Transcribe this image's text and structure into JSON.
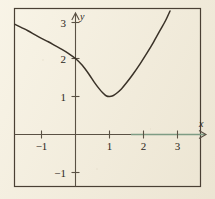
{
  "figure": {
    "background_color": "#f0ead9",
    "frame_color": "#4a4034",
    "axis_color": "#5a5144",
    "axis_highlight_color": "#7e9c84",
    "curve_color": "#3a3228",
    "label_color": "#2b2620"
  },
  "axes": {
    "x_name": "x",
    "y_name": "y",
    "x_ticks": [
      {
        "value": -1,
        "label": "−1"
      },
      {
        "value": 1,
        "label": "1"
      },
      {
        "value": 2,
        "label": "2"
      },
      {
        "value": 3,
        "label": "3"
      }
    ],
    "y_ticks": [
      {
        "value": 3,
        "label": "3"
      },
      {
        "value": 2,
        "label": "2"
      },
      {
        "value": 1,
        "label": "1"
      },
      {
        "value": -1,
        "label": "−1"
      }
    ]
  },
  "chart_data": {
    "type": "line",
    "title": "",
    "subtitle": "",
    "xlabel": "x",
    "ylabel": "y",
    "xlim": [
      -1.78,
      3.68
    ],
    "ylim": [
      -1.35,
      3.32
    ],
    "grid": false,
    "legend": null,
    "annotations": [],
    "series": [
      {
        "name": "curve",
        "color": "#3a3228",
        "minimum": {
          "x": 1,
          "y": 1
        },
        "y_intercept": 2,
        "x": [
          -1.78,
          -1.6,
          -1.4,
          -1.2,
          -1.0,
          -0.8,
          -0.6,
          -0.4,
          -0.2,
          0.0,
          0.2,
          0.4,
          0.55,
          0.7,
          0.8,
          0.9,
          1.0,
          1.1,
          1.2,
          1.35,
          1.5,
          1.7,
          1.9,
          2.1,
          2.3,
          2.5,
          2.65,
          2.78
        ],
        "y": [
          2.9,
          2.82,
          2.73,
          2.63,
          2.53,
          2.44,
          2.34,
          2.24,
          2.13,
          2.0,
          1.82,
          1.58,
          1.38,
          1.2,
          1.1,
          1.02,
          1.0,
          1.02,
          1.08,
          1.2,
          1.36,
          1.6,
          1.86,
          2.14,
          2.44,
          2.76,
          3.0,
          3.25
        ]
      }
    ]
  }
}
